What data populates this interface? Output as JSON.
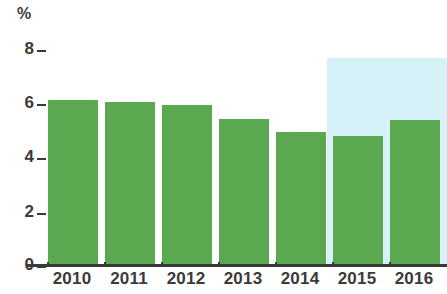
{
  "chart_data": {
    "type": "bar",
    "title": "",
    "subtitle": "",
    "xlabel": "",
    "ylabel": "%",
    "unit_label": "%",
    "categories": [
      "2010",
      "2011",
      "2012",
      "2013",
      "2014",
      "2015",
      "2016"
    ],
    "values": [
      6.1,
      6.0,
      5.9,
      5.4,
      4.9,
      4.75,
      5.35
    ],
    "series": [
      {
        "name": "",
        "values": [
          6.1,
          6.0,
          5.9,
          5.4,
          4.9,
          4.75,
          5.35
        ]
      }
    ],
    "ylim": [
      0,
      8
    ],
    "y_ticks": [
      8,
      6,
      4,
      2,
      0
    ],
    "y_tick_labels": [
      "8",
      "6",
      "4",
      "2",
      "0"
    ],
    "grid": false,
    "legend": null,
    "legend_position": "none",
    "annotations": [
      {
        "type": "highlight-band",
        "covers_categories": [
          "2015",
          "2016"
        ],
        "color": "#d6f2f8"
      }
    ],
    "colors": {
      "bar": "#5aa850",
      "highlight_band": "#d6f2f8",
      "axis": "#3a3a3a",
      "text": "#3a3a3a",
      "background": "#ffffff"
    }
  }
}
